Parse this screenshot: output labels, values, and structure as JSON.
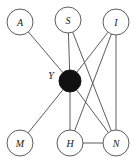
{
  "figure": {
    "background_color": "#ffffff",
    "width": 136,
    "height": 163
  },
  "style": {
    "edge_color": "#4a4a4a",
    "node_stroke_color": "#4a4a4a",
    "node_fill_color": "#ffffff",
    "hub_fill_color": "#111111",
    "label_color": "#1a1a1a"
  },
  "chart_data": {
    "type": "diagram",
    "subtype": "node-link-graph",
    "directed": false,
    "nodes": [
      {
        "id": "A",
        "label": "A",
        "cx": 20,
        "cy": 22,
        "r": 13,
        "filled": false,
        "label_position": "inside"
      },
      {
        "id": "S",
        "label": "S",
        "cx": 68,
        "cy": 20,
        "r": 13,
        "filled": false,
        "label_position": "inside"
      },
      {
        "id": "I",
        "label": "I",
        "cx": 116,
        "cy": 22,
        "r": 13,
        "filled": false,
        "label_position": "inside"
      },
      {
        "id": "Y",
        "label": "Y",
        "cx": 70,
        "cy": 81,
        "r": 11,
        "filled": true,
        "label_position": "left"
      },
      {
        "id": "M",
        "label": "M",
        "cx": 20,
        "cy": 143,
        "r": 13,
        "filled": false,
        "label_position": "inside"
      },
      {
        "id": "H",
        "label": "H",
        "cx": 70,
        "cy": 143,
        "r": 13,
        "filled": false,
        "label_position": "inside"
      },
      {
        "id": "N",
        "label": "N",
        "cx": 116,
        "cy": 143,
        "r": 13,
        "filled": false,
        "label_position": "inside"
      }
    ],
    "edges": [
      {
        "source": "A",
        "target": "Y"
      },
      {
        "source": "S",
        "target": "Y"
      },
      {
        "source": "I",
        "target": "Y"
      },
      {
        "source": "M",
        "target": "Y"
      },
      {
        "source": "H",
        "target": "Y"
      },
      {
        "source": "N",
        "target": "Y"
      },
      {
        "source": "S",
        "target": "N"
      },
      {
        "source": "I",
        "target": "H"
      },
      {
        "source": "I",
        "target": "N"
      },
      {
        "source": "H",
        "target": "N"
      }
    ],
    "node_labels": [
      "A",
      "S",
      "I",
      "Y",
      "M",
      "H",
      "N"
    ],
    "hub_node": "Y",
    "edge_count": 10,
    "node_count": 7
  }
}
